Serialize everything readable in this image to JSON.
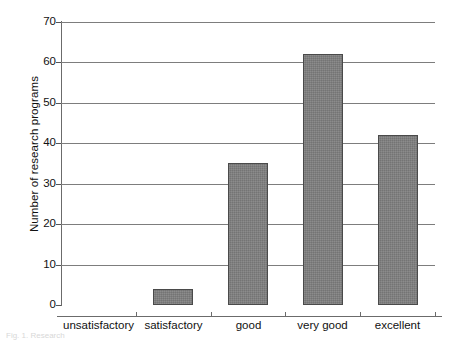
{
  "chart_data": {
    "type": "bar",
    "title": "",
    "xlabel": "",
    "ylabel": "Number of research programs",
    "categories": [
      "unsatisfactory",
      "satisfactory",
      "good",
      "very good",
      "excellent"
    ],
    "values": [
      0,
      4,
      35,
      62,
      42
    ],
    "ylim": [
      0,
      70
    ],
    "yticks": [
      0,
      10,
      20,
      30,
      40,
      50,
      60,
      70
    ],
    "ytick_labels": [
      "0",
      "10",
      "20",
      "30",
      "40",
      "50",
      "60",
      "70"
    ],
    "grid": true,
    "legend": null,
    "bar_color": "#7e7e7e",
    "bar_edge_color": "#4a4a4a",
    "gridline_color": "#7d7d7d",
    "axis_color": "#6b6b6b",
    "background_color": "#ffffff"
  },
  "caption": {
    "text": "Fig. 1.  Research"
  }
}
